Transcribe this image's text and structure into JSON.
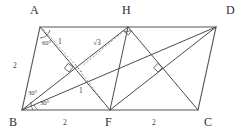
{
  "figure": {
    "shape_type": "parallelogram",
    "stroke_color": "#55555d",
    "dash_color": "#8b8b93",
    "background_color": "#ffffff",
    "vertices": [
      {
        "name": "A",
        "label": "A",
        "x": 40,
        "y": 27,
        "label_x": 30,
        "label_y": 4
      },
      {
        "name": "D",
        "label": "D",
        "x": 216,
        "y": 27,
        "label_x": 226,
        "label_y": 4
      },
      {
        "name": "B",
        "label": "B",
        "x": 22,
        "y": 110,
        "label_x": 9,
        "label_y": 116
      },
      {
        "name": "C",
        "label": "C",
        "x": 198,
        "y": 110,
        "label_x": 204,
        "label_y": 116
      },
      {
        "name": "H",
        "label": "H",
        "x": 128,
        "y": 27,
        "label_x": 122,
        "label_y": 4
      },
      {
        "name": "F",
        "label": "F",
        "x": 110,
        "y": 110,
        "label_x": 105,
        "label_y": 116
      }
    ],
    "side_measures": [
      {
        "name": "segment-ab",
        "label": "2",
        "x": 13,
        "y": 62
      },
      {
        "name": "segment-bf",
        "label": "2",
        "x": 63,
        "y": 119
      },
      {
        "name": "segment-fc",
        "label": "2",
        "x": 152,
        "y": 119
      }
    ],
    "cevian_measures": [
      {
        "name": "segment-a-perp",
        "label": "1",
        "x": 58,
        "y": 38
      },
      {
        "name": "segment-f-perp",
        "label": "1",
        "x": 79,
        "y": 87
      },
      {
        "name": "segment-altitude",
        "label": "√3",
        "x": 93,
        "y": 39
      }
    ],
    "angles": [
      {
        "name": "angle-at-a",
        "label": "60°",
        "x": 42,
        "y": 40
      },
      {
        "name": "angle-abh",
        "label": "30°",
        "x": 28,
        "y": 90
      },
      {
        "name": "angle-hbf",
        "label": "30°",
        "x": 40,
        "y": 100
      }
    ],
    "right_angle_marks": [
      {
        "name": "right-angle-at-h",
        "x": 128,
        "y": 27
      },
      {
        "name": "right-angle-left-intersection",
        "x": 69,
        "y": 68
      },
      {
        "name": "right-angle-right-intersection",
        "x": 158,
        "y": 68
      }
    ]
  }
}
